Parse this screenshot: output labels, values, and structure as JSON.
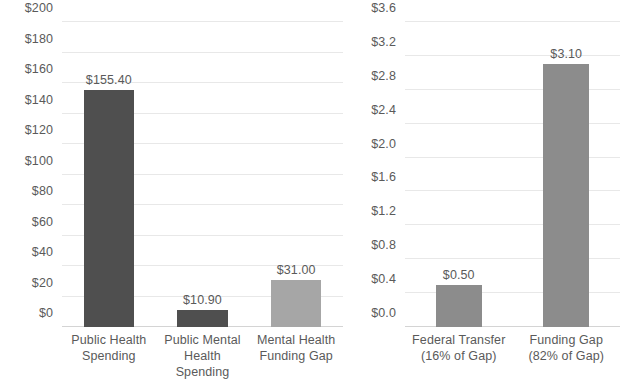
{
  "chart_data": [
    {
      "id": "left",
      "type": "bar",
      "title": "",
      "xlabel": "",
      "ylabel": "",
      "ylim": [
        0,
        200
      ],
      "ystep": 20,
      "grid": true,
      "legend": "none",
      "value_prefix": "$",
      "categories": [
        "Public Health\nSpending",
        "Public Mental\nHealth Spending",
        "Mental Health\nFunding Gap"
      ],
      "values": [
        155.4,
        10.9,
        31.0
      ],
      "data_labels": [
        "$155.40",
        "$10.90",
        "$31.00"
      ],
      "bar_colors": [
        "#4f4f4f",
        "#4f4f4f",
        "#a6a6a6"
      ],
      "tick_labels": [
        "$0",
        "$20",
        "$40",
        "$60",
        "$80",
        "$100",
        "$120",
        "$140",
        "$160",
        "$180",
        "$200"
      ],
      "tick_values": [
        0,
        20,
        40,
        60,
        80,
        100,
        120,
        140,
        160,
        180,
        200
      ]
    },
    {
      "id": "right",
      "type": "bar",
      "title": "",
      "xlabel": "",
      "ylabel": "",
      "ylim": [
        0,
        3.6
      ],
      "ystep": 0.4,
      "grid": true,
      "legend": "none",
      "value_prefix": "$",
      "categories": [
        "Federal Transfer\n(16% of Gap)",
        "Funding Gap\n(82% of Gap)"
      ],
      "values": [
        0.5,
        3.1
      ],
      "data_labels": [
        "$0.50",
        "$3.10"
      ],
      "bar_colors": [
        "#8c8c8c",
        "#8c8c8c"
      ],
      "tick_labels": [
        "$0.0",
        "$0.4",
        "$0.8",
        "$1.2",
        "$1.6",
        "$2.0",
        "$2.4",
        "$2.8",
        "$3.2",
        "$3.6"
      ],
      "tick_values": [
        0,
        0.4,
        0.8,
        1.2,
        1.6,
        2.0,
        2.4,
        2.8,
        3.2,
        3.6
      ]
    }
  ],
  "colors": {
    "background": "#ffffff",
    "gridline": "#e8e8e8",
    "axis": "#d4d4d4",
    "text": "#5a5a5a",
    "bar_dark": "#4f4f4f",
    "bar_mid": "#8c8c8c",
    "bar_light": "#a6a6a6"
  }
}
